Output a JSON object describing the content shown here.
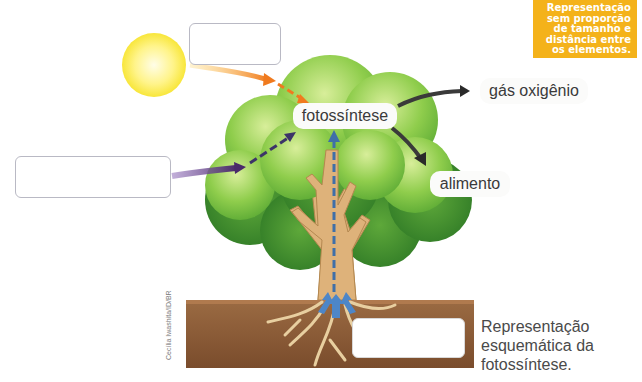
{
  "diagram": {
    "title": "Representação esquemática da fotossíntese",
    "note_badge": {
      "lines": [
        "Representação",
        "sem proporção",
        "de tamanho e",
        "distância entre",
        "os elementos."
      ],
      "color": "#f4b21a"
    },
    "center_label": "fotossíntese",
    "outputs": {
      "oxygen": "gás oxigênio",
      "food": "alimento"
    },
    "blank_boxes": [
      {
        "id": "light-input",
        "value": ""
      },
      {
        "id": "air-input",
        "value": ""
      },
      {
        "id": "soil-input",
        "value": ""
      }
    ],
    "caption": {
      "lines": [
        "Representação",
        "esquemática da",
        "fotossíntese."
      ]
    },
    "credit": "Cecília Iwashita/ID/BR",
    "colors": {
      "sun": "#ffee44",
      "light_arrow": "#f07a1e",
      "air_arrow": "#5a3a7a",
      "water_arrow": "#3f6fa8",
      "output_arrow": "#3a3a3a",
      "leaves": "#7cc242",
      "leaves_dark": "#3d8a2a",
      "trunk": "#deb27a",
      "soil": "#8a5a36"
    }
  }
}
